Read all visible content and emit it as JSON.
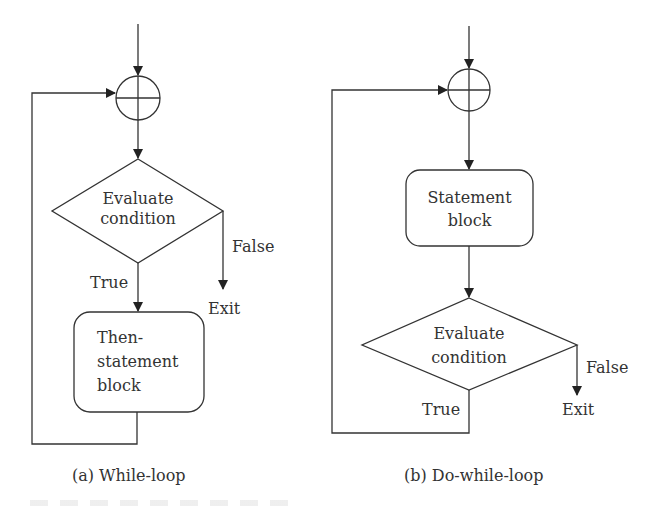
{
  "diagram": {
    "type": "flowchart",
    "panels": [
      {
        "id": "a",
        "caption": "(a) While-loop",
        "junction": "summing-junction-circle",
        "decision": {
          "line1": "Evaluate",
          "line2": "condition"
        },
        "true_label": "True",
        "false_label": "False",
        "exit_label": "Exit",
        "block": {
          "line1": "Then-",
          "line2": "statement",
          "line3": "block"
        }
      },
      {
        "id": "b",
        "caption": "(b) Do-while-loop",
        "junction": "summing-junction-circle",
        "block": {
          "line1": "Statement",
          "line2": "block"
        },
        "decision": {
          "line1": "Evaluate",
          "line2": "condition"
        },
        "true_label": "True",
        "false_label": "False",
        "exit_label": "Exit"
      }
    ],
    "colors": {
      "stroke": "#333333",
      "background": "#ffffff"
    }
  }
}
